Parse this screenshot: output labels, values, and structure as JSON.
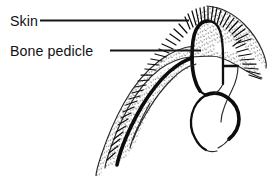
{
  "figure": {
    "kind": "anatomical-line-drawing",
    "background_color": "#ffffff",
    "ink_color": "#101010",
    "labels": [
      {
        "id": "skin",
        "text": "Skin",
        "text_x": 10,
        "text_y": 26,
        "leader": {
          "x1": 40,
          "y1": 20.5,
          "x2": 189,
          "y2": 20.5
        }
      },
      {
        "id": "bone-pedicle",
        "text": "Bone pedicle",
        "text_x": 10,
        "text_y": 56,
        "leader": {
          "x1": 110,
          "y1": 50.5,
          "x2": 201,
          "y2": 50.5
        }
      }
    ],
    "structures": [
      {
        "id": "periosteum-flap",
        "name": "stippled and hatched skin / periosteum flap"
      },
      {
        "id": "bone-pedicle-column",
        "name": "central bone pedicle column"
      },
      {
        "id": "bone-cavity-loop",
        "name": "lower rounded bone cavity outline"
      },
      {
        "id": "lateral-bone-shelf",
        "name": "right lateral bone shelf"
      }
    ]
  }
}
